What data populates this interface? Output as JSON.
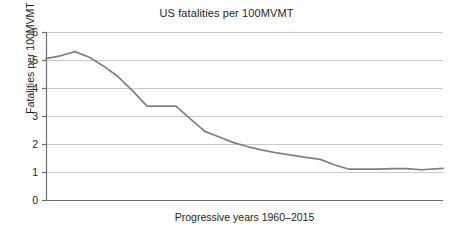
{
  "chart_data": {
    "type": "line",
    "title": "US fatalities per 100MVMT",
    "xlabel": "Progressive years 1960–2015",
    "ylabel": "Fatalities per 100MVMT",
    "ylim": [
      0,
      6
    ],
    "yticks": [
      0,
      1,
      2,
      3,
      4,
      5,
      6
    ],
    "ytick_labels": [
      "0",
      "1",
      "2",
      "3",
      "4",
      "5",
      "6"
    ],
    "xlim": [
      1960,
      2015
    ],
    "xticks": [],
    "xtick_labels": [],
    "grid": "horizontal",
    "legend": "none",
    "line_color": "#808080",
    "axis_color": "#6d6e71",
    "gridline_color": "#c9c9c9",
    "series": [
      {
        "name": "US fatalities per 100MVMT",
        "x": [
          1960,
          1962,
          1964,
          1966,
          1968,
          1970,
          1972,
          1974,
          1976,
          1978,
          1980,
          1982,
          1984,
          1986,
          1988,
          1990,
          1992,
          1994,
          1996,
          1998,
          2000,
          2002,
          2004,
          2006,
          2008,
          2010,
          2012,
          2015
        ],
        "values": [
          5.05,
          5.15,
          5.3,
          5.1,
          4.78,
          4.4,
          3.9,
          3.35,
          3.35,
          3.35,
          2.9,
          2.45,
          2.25,
          2.05,
          1.9,
          1.78,
          1.68,
          1.6,
          1.52,
          1.45,
          1.25,
          1.1,
          1.1,
          1.1,
          1.12,
          1.12,
          1.08,
          1.13
        ]
      }
    ]
  },
  "axis_labels": {
    "y": [
      "6",
      "5",
      "4",
      "3",
      "2",
      "1",
      "0"
    ]
  }
}
